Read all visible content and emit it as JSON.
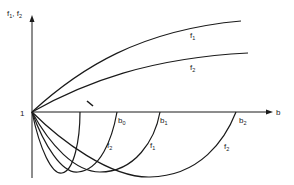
{
  "diagram": {
    "y_axis_label": "f1, f2",
    "x_axis_label": "b",
    "origin_label": "1",
    "upper_curves": [
      {
        "name": "f1",
        "label": "f",
        "sub": "1"
      },
      {
        "name": "f2",
        "label": "f",
        "sub": "2"
      }
    ],
    "lower_curves": [
      {
        "name": "f2-small",
        "label": "f",
        "sub": "2",
        "root_label": "b",
        "root_sub": "0"
      },
      {
        "name": "f1",
        "label": "f",
        "sub": "1",
        "root_label": "b",
        "root_sub": "1"
      },
      {
        "name": "f2-large",
        "label": "f",
        "sub": "2",
        "root_label": "b",
        "root_sub": "2"
      }
    ],
    "colors": {
      "stroke": "#1a1a1a",
      "background": "#ffffff"
    }
  }
}
